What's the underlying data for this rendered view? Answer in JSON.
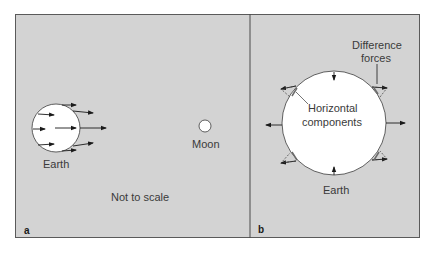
{
  "figure": {
    "background_color": "#d3d3d3",
    "frame_color": "#5a5a5a",
    "panel_a": {
      "letter": "a",
      "earth_label": "Earth",
      "moon_label": "Moon",
      "note": "Not to scale"
    },
    "panel_b": {
      "letter": "b",
      "earth_label": "Earth",
      "difference_forces_label_line1": "Difference",
      "difference_forces_label_line2": "forces",
      "horizontal_components_line1": "Horizontal",
      "horizontal_components_line2": "components"
    }
  }
}
